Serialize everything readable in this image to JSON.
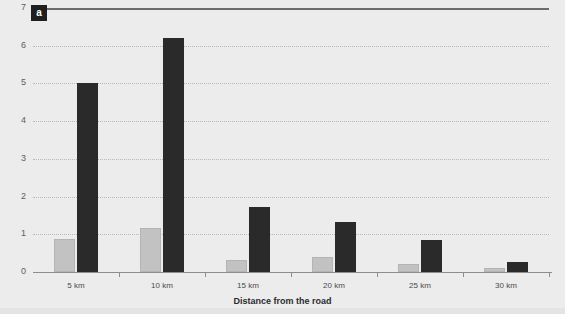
{
  "panel": {
    "label": "a"
  },
  "chart_data": {
    "type": "bar",
    "title": "",
    "subtitle": "",
    "xlabel": "Distance from the road",
    "ylabel": "",
    "categories": [
      "5 km",
      "10 km",
      "15 km",
      "20 km",
      "25 km",
      "30 km"
    ],
    "series": [
      {
        "name": "light-gray-series",
        "color": "#c2c2c2",
        "values": [
          0.88,
          1.17,
          0.32,
          0.4,
          0.22,
          0.1
        ]
      },
      {
        "name": "dark-series",
        "color": "#2a2a2a",
        "values": [
          5.0,
          6.2,
          1.72,
          1.33,
          0.85,
          0.27
        ]
      }
    ],
    "ylim": [
      0,
      7
    ],
    "yticks": [
      0,
      1,
      2,
      3,
      4,
      5,
      6,
      7
    ],
    "ytick_labels": [
      "0",
      "1",
      "2",
      "3",
      "4",
      "5",
      "6",
      "7"
    ],
    "grid": true,
    "grid_axis": "y",
    "legend": "none"
  },
  "colors": {
    "background": "#ececec",
    "grid": "#b8b8b8",
    "axis": "#8d8d8d",
    "top_rule": "#6c6c6c",
    "text": "#4a4a4a",
    "panel_label_bg": "#1f1f1f",
    "panel_label_fg": "#ffffff"
  }
}
